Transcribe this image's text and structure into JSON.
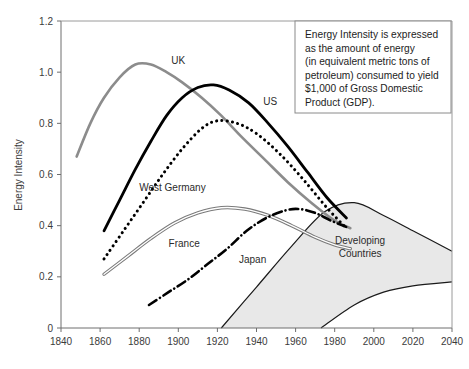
{
  "chart_data": {
    "type": "line",
    "title": "",
    "xlabel": "",
    "ylabel": "Energy Intensity",
    "xlim": [
      1840,
      2040
    ],
    "ylim": [
      0,
      1.2
    ],
    "xticks": [
      1840,
      1860,
      1880,
      1900,
      1920,
      1940,
      1960,
      1980,
      2000,
      2020,
      2040
    ],
    "yticks": [
      "0",
      "0.2",
      "0.4",
      "0.6",
      "0.8",
      "1.0",
      "1.2"
    ],
    "ytick_values": [
      0,
      0.2,
      0.4,
      0.6,
      0.8,
      1.0,
      1.2
    ],
    "grid": false,
    "legend_position": "inline-labels",
    "series": [
      {
        "name": "UK",
        "style": "solid-gray",
        "color": "#8c8c8c",
        "label_x": 1900,
        "label_y": 1.03,
        "x": [
          1848,
          1855,
          1862,
          1870,
          1878,
          1886,
          1894,
          1902,
          1912,
          1922,
          1932,
          1944,
          1956,
          1968,
          1980,
          1988
        ],
        "y": [
          0.67,
          0.8,
          0.9,
          0.98,
          1.03,
          1.03,
          1.0,
          0.96,
          0.9,
          0.83,
          0.75,
          0.66,
          0.57,
          0.49,
          0.42,
          0.39
        ]
      },
      {
        "name": "US",
        "style": "solid-black",
        "color": "#000000",
        "label_x": 1947,
        "label_y": 0.87,
        "x": [
          1862,
          1870,
          1878,
          1886,
          1894,
          1902,
          1910,
          1918,
          1926,
          1936,
          1946,
          1956,
          1966,
          1976,
          1986
        ],
        "y": [
          0.38,
          0.5,
          0.62,
          0.73,
          0.83,
          0.9,
          0.94,
          0.95,
          0.93,
          0.88,
          0.8,
          0.71,
          0.61,
          0.51,
          0.43
        ]
      },
      {
        "name": "West Germany",
        "style": "dotted-black",
        "color": "#000000",
        "label_x": 1897,
        "label_y": 0.535,
        "x": [
          1862,
          1872,
          1882,
          1892,
          1902,
          1912,
          1920,
          1930,
          1940,
          1952,
          1964,
          1976,
          1986
        ],
        "y": [
          0.27,
          0.38,
          0.49,
          0.6,
          0.7,
          0.78,
          0.81,
          0.8,
          0.76,
          0.68,
          0.58,
          0.47,
          0.39
        ]
      },
      {
        "name": "France",
        "style": "double-line-gray",
        "color": "#7a7a7a",
        "label_x": 1903,
        "label_y": 0.315,
        "x": [
          1862,
          1874,
          1886,
          1898,
          1910,
          1922,
          1934,
          1946,
          1958,
          1970,
          1980,
          1988
        ],
        "y": [
          0.21,
          0.28,
          0.35,
          0.41,
          0.45,
          0.47,
          0.465,
          0.44,
          0.4,
          0.355,
          0.325,
          0.31
        ]
      },
      {
        "name": "Japan",
        "style": "dash-dot-black",
        "color": "#000000",
        "label_x": 1938,
        "label_y": 0.255,
        "x": [
          1885,
          1895,
          1905,
          1915,
          1925,
          1935,
          1945,
          1955,
          1962,
          1970,
          1978,
          1986
        ],
        "y": [
          0.09,
          0.14,
          0.19,
          0.25,
          0.31,
          0.38,
          0.43,
          0.46,
          0.465,
          0.45,
          0.42,
          0.395
        ]
      }
    ],
    "bands": [
      {
        "name": "Developing Countries",
        "fill": "#e8e8e8",
        "label_line1": "Developing",
        "label_line2": "Countries",
        "label_x": 1993,
        "label_y": 0.33,
        "upper_x": [
          1922,
          1940,
          1958,
          1975,
          1990,
          2005,
          2020,
          2040
        ],
        "upper_y": [
          0.0,
          0.16,
          0.32,
          0.455,
          0.49,
          0.44,
          0.38,
          0.3
        ],
        "lower_x": [
          1973,
          1990,
          2005,
          2020,
          2040
        ],
        "lower_y": [
          0.0,
          0.09,
          0.14,
          0.165,
          0.18
        ]
      }
    ],
    "annotation": {
      "lines": [
        "Energy Intensity is expressed",
        "as the amount of energy",
        "(in equivalent metric tons of",
        "petroleum) consumed to yield",
        "$1,000 of Gross Domestic",
        "Product (GDP)."
      ]
    }
  },
  "colors": {
    "background": "#ffffff",
    "axis": "#6e6e6e",
    "text": "#2b2b2b",
    "band_fill": "#e8e8e8",
    "uk": "#8c8c8c",
    "us": "#000000",
    "west_germany": "#000000",
    "france": "#7a7a7a",
    "japan": "#000000"
  }
}
